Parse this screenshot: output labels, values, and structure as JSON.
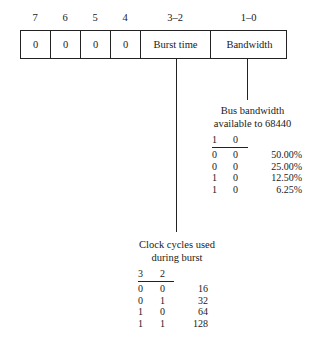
{
  "register": {
    "bit_labels": [
      "7",
      "6",
      "5",
      "4",
      "3–2",
      "1–0"
    ],
    "fields": [
      "0",
      "0",
      "0",
      "0",
      "Burst time",
      "Bandwidth"
    ]
  },
  "bandwidth_table": {
    "caption_line1": "Bus bandwidth",
    "caption_line2": "available to 68440",
    "headers": [
      "1",
      "0"
    ],
    "rows": [
      {
        "b1": "0",
        "b0": "0",
        "value": "50.00%"
      },
      {
        "b1": "0",
        "b0": "0",
        "value": "25.00%"
      },
      {
        "b1": "1",
        "b0": "0",
        "value": "12.50%"
      },
      {
        "b1": "1",
        "b0": "0",
        "value": "6.25%"
      }
    ]
  },
  "burst_table": {
    "caption_line1": "Clock cycles used",
    "caption_line2": "during burst",
    "headers": [
      "3",
      "2"
    ],
    "rows": [
      {
        "b1": "0",
        "b0": "0",
        "value": "16"
      },
      {
        "b1": "0",
        "b0": "1",
        "value": "32"
      },
      {
        "b1": "1",
        "b0": "0",
        "value": "64"
      },
      {
        "b1": "1",
        "b0": "1",
        "value": "128"
      }
    ]
  }
}
